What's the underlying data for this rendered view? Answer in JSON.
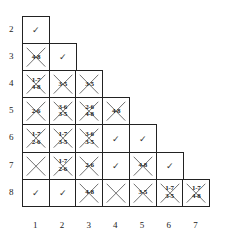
{
  "row_labels": [
    "2",
    "3",
    "4",
    "5",
    "6",
    "7",
    "8"
  ],
  "col_labels": [
    "1",
    "2",
    "3",
    "4",
    "5",
    "6",
    "7"
  ],
  "rows": [
    {
      "row": "2",
      "cells": [
        {
          "type": "check",
          "text": "✓"
        }
      ]
    },
    {
      "row": "3",
      "cells": [
        {
          "type": "cross",
          "text": "4-8"
        },
        {
          "type": "check",
          "text": "✓"
        }
      ]
    },
    {
      "row": "4",
      "cells": [
        {
          "type": "cross",
          "text": "1-7\n4-8"
        },
        {
          "type": "cross",
          "text": "3-5"
        },
        {
          "type": "cross",
          "text": "3-5"
        }
      ]
    },
    {
      "row": "5",
      "cells": [
        {
          "type": "cross",
          "text": "2-6"
        },
        {
          "type": "cross",
          "text": "3-6\n3-5"
        },
        {
          "type": "cross",
          "text": "2-6\n4-8"
        },
        {
          "type": "cross",
          "text": "4-8"
        }
      ]
    },
    {
      "row": "6",
      "cells": [
        {
          "type": "cross",
          "text": "1-7\n2-6"
        },
        {
          "type": "cross",
          "text": "1-7\n3-5"
        },
        {
          "type": "cross",
          "text": "3-6\n3-5"
        },
        {
          "type": "check",
          "text": "✓"
        },
        {
          "type": "check",
          "text": "✓"
        }
      ]
    },
    {
      "row": "7",
      "cells": [
        {
          "type": "cross",
          "text": ""
        },
        {
          "type": "cross",
          "text": "1-7\n2-6"
        },
        {
          "type": "cross",
          "text": "2-6"
        },
        {
          "type": "check",
          "text": "✓"
        },
        {
          "type": "cross",
          "text": "4-8"
        },
        {
          "type": "check",
          "text": "✓"
        }
      ]
    },
    {
      "row": "8",
      "cells": [
        {
          "type": "check",
          "text": "✓"
        },
        {
          "type": "check",
          "text": "✓"
        },
        {
          "type": "cross",
          "text": "4-8"
        },
        {
          "type": "cross",
          "text": ""
        },
        {
          "type": "cross",
          "text": "3-5"
        },
        {
          "type": "cross",
          "text": "1-7\n3-5"
        },
        {
          "type": "cross",
          "text": "1-7\n4-8"
        }
      ]
    }
  ]
}
